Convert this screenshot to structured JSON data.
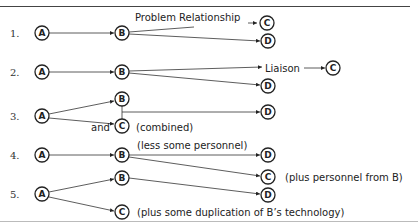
{
  "diagram": {
    "rows": [
      {
        "number": "1.",
        "nodes": {
          "A": "A",
          "B": "B",
          "C": "C",
          "D": "D"
        },
        "labels": {
          "relationship": "Problem Relationship"
        }
      },
      {
        "number": "2.",
        "nodes": {
          "A": "A",
          "B": "B",
          "C": "C",
          "D": "D"
        },
        "labels": {
          "liaison": "Liaison"
        }
      },
      {
        "number": "3.",
        "nodes": {
          "A": "A",
          "B": "B",
          "C": "C",
          "D": "D"
        },
        "labels": {
          "and": "and",
          "combined": "(combined)"
        }
      },
      {
        "number": "4.",
        "nodes": {
          "A": "A",
          "B": "B",
          "C": "C",
          "D": "D"
        },
        "labels": {
          "less": "(less some personnel)",
          "plus": "(plus personnel from B)"
        }
      },
      {
        "number": "5.",
        "nodes": {
          "A": "A",
          "B": "B",
          "C": "C",
          "D": "D"
        },
        "labels": {
          "duplication": "(plus some duplication of B’s technology)"
        }
      }
    ]
  }
}
